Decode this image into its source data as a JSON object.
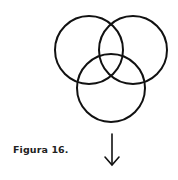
{
  "figure": {
    "caption": "Figura 16.",
    "stroke_color": "#111111",
    "circles": [
      {
        "name": "left",
        "cx": 89,
        "cy": 50,
        "r": 34
      },
      {
        "name": "right",
        "cx": 133,
        "cy": 50,
        "r": 34
      },
      {
        "name": "bottom",
        "cx": 111,
        "cy": 88,
        "r": 34
      }
    ],
    "arrow": {
      "x": 112,
      "y1": 134,
      "y2": 165,
      "direction": "down"
    }
  }
}
